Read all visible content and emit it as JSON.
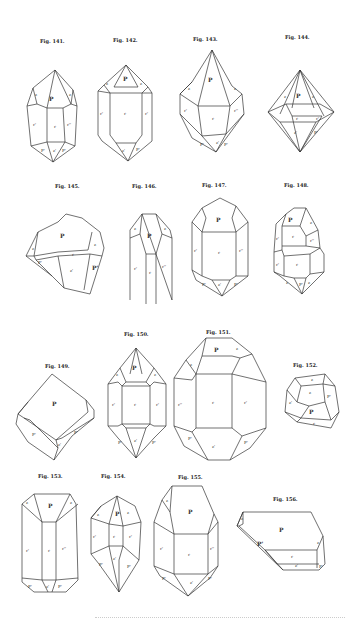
{
  "figures": [
    {
      "id": "141",
      "caption": "Fig. 141.",
      "faces": [
        "P",
        "z",
        "z",
        "r'",
        "r",
        "r''",
        "P'",
        "z'",
        "P'"
      ]
    },
    {
      "id": "142",
      "caption": "Fig. 142.",
      "faces": [
        "P",
        "z",
        "z",
        "r'",
        "r",
        "r'",
        "z'",
        "P'"
      ]
    },
    {
      "id": "143",
      "caption": "Fig. 143.",
      "faces": [
        "P",
        "z",
        "z",
        "r'",
        "r",
        "r''",
        "P'",
        "z'",
        "P'"
      ]
    },
    {
      "id": "144",
      "caption": "Fig. 144.",
      "faces": [
        "P",
        "z",
        "z",
        "r",
        "r'",
        "z'",
        "P'"
      ]
    },
    {
      "id": "145",
      "caption": "Fig. 145.",
      "faces": [
        "P",
        "z",
        "z",
        "r",
        "z'",
        "P'",
        "P'"
      ]
    },
    {
      "id": "146",
      "caption": "Fig. 146.",
      "faces": [
        "P",
        "z",
        "z",
        "r'",
        "r",
        "r''"
      ]
    },
    {
      "id": "147",
      "caption": "Fig. 147.",
      "faces": [
        "P",
        "r'",
        "r",
        "r''",
        "P'",
        "z'",
        "P'"
      ]
    },
    {
      "id": "148",
      "caption": "Fig. 148.",
      "faces": [
        "P",
        "z",
        "r",
        "r'",
        "r''",
        "r",
        "r'",
        "z",
        "P'",
        "z"
      ]
    },
    {
      "id": "149",
      "caption": "Fig. 149.",
      "faces": [
        "P",
        "P'",
        "z'",
        "P'"
      ]
    },
    {
      "id": "150",
      "caption": "Fig. 150.",
      "faces": [
        "P",
        "z",
        "z",
        "r'",
        "r",
        "r'",
        "P'",
        "z'",
        "P'"
      ]
    },
    {
      "id": "151",
      "caption": "Fig. 151.",
      "faces": [
        "P",
        "z",
        "z",
        "r''",
        "r",
        "r'",
        "z'",
        "P'",
        "P'"
      ]
    },
    {
      "id": "152",
      "caption": "Fig. 152.",
      "faces": [
        "z",
        "z",
        "P'",
        "P",
        "z'",
        "r"
      ]
    },
    {
      "id": "153",
      "caption": "Fig. 153.",
      "faces": [
        "P",
        "z",
        "z",
        "r'",
        "r",
        "r''",
        "P'",
        "z'",
        "P'"
      ]
    },
    {
      "id": "154",
      "caption": "Fig. 154.",
      "faces": [
        "P",
        "z",
        "z",
        "r'",
        "r",
        "r'",
        "P'",
        "z'",
        "P'"
      ]
    },
    {
      "id": "155",
      "caption": "Fig. 155.",
      "faces": [
        "P",
        "z",
        "r'",
        "r",
        "r''",
        "P'",
        "z'",
        "P'"
      ]
    },
    {
      "id": "156",
      "caption": "Fig. 156.",
      "faces": [
        "P",
        "z",
        "z",
        "r",
        "z'",
        "P'",
        "P'"
      ]
    }
  ]
}
